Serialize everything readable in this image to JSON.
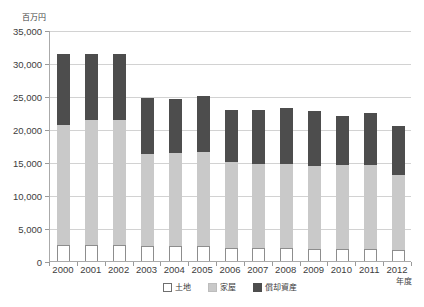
{
  "chart_data": {
    "type": "bar",
    "subtype": "stacked-bar",
    "title": "",
    "unit_label": "百万円",
    "xlabel": "年度",
    "ylabel": "",
    "ylim": [
      0,
      35000
    ],
    "ytick_step": 5000,
    "yticks": [
      "0",
      "5,000",
      "10,000",
      "15,000",
      "20,000",
      "25,000",
      "30,000",
      "35,000"
    ],
    "ytick_values": [
      0,
      5000,
      10000,
      15000,
      20000,
      25000,
      30000,
      35000
    ],
    "grid": true,
    "legend_position": "bottom",
    "categories": [
      "2000",
      "2001",
      "2002",
      "2003",
      "2004",
      "2005",
      "2006",
      "2007",
      "2008",
      "2009",
      "2010",
      "2011",
      "2012"
    ],
    "series": [
      {
        "name": "土地",
        "color": "#ffffff",
        "values": [
          2450,
          2450,
          2400,
          2200,
          2300,
          2300,
          1900,
          1900,
          1900,
          1800,
          1800,
          1750,
          1700
        ]
      },
      {
        "name": "家屋",
        "color": "#c9c9c9",
        "values": [
          18100,
          18900,
          19000,
          14000,
          14000,
          14200,
          13100,
          12800,
          12800,
          12600,
          12800,
          12800,
          11300
        ]
      },
      {
        "name": "償却資産",
        "color": "#4d4d4d",
        "values": [
          10750,
          10000,
          9900,
          8500,
          8200,
          8500,
          7900,
          8200,
          8500,
          8400,
          7400,
          7950,
          7500
        ]
      }
    ],
    "totals": [
      31300,
      31350,
      31300,
      24700,
      24500,
      25000,
      22900,
      22900,
      23200,
      22800,
      22000,
      22500,
      20500
    ]
  },
  "legend": {
    "items": [
      {
        "label": "土地",
        "swatch": "land-swatch"
      },
      {
        "label": "家屋",
        "swatch": "house-swatch"
      },
      {
        "label": "償却資産",
        "swatch": "asset-swatch"
      }
    ]
  },
  "colors": {
    "top_segment": "#4d4d4d",
    "mid_segment": "#c9c9c9",
    "bottom_segment": "#ffffff",
    "gridline": "#d2d2d2",
    "axis": "#aaaaaa",
    "text": "#3d3d3d"
  }
}
